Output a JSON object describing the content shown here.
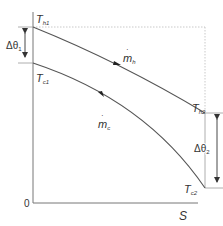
{
  "diagram": {
    "type": "temperature-area profile (counterflow heat exchanger)",
    "axes": {
      "origin_label": "0",
      "x_label": "S"
    },
    "curves": [
      {
        "name": "hot-stream",
        "flow_label": "m",
        "flow_sub": "h",
        "start_label": "T",
        "start_sub": "h1",
        "end_label": "T",
        "end_sub": "h2",
        "arrow_direction": "forward"
      },
      {
        "name": "cold-stream",
        "flow_label": "m",
        "flow_sub": "c",
        "start_label": "T",
        "start_sub": "c1",
        "end_label": "T",
        "end_sub": "c2",
        "arrow_direction": "backward"
      }
    ],
    "dimensions": [
      {
        "name": "delta-theta-1",
        "label": "Δθ",
        "sub": "1"
      },
      {
        "name": "delta-theta-2",
        "label": "Δθ",
        "sub": "2"
      }
    ],
    "colors": {
      "line": "#555555",
      "guide": "#bbbbbb",
      "text": "#333333"
    }
  }
}
